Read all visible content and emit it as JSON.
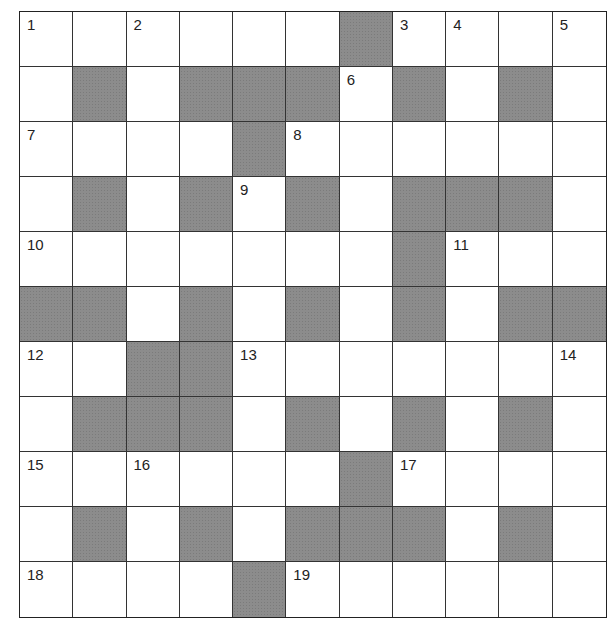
{
  "puzzle": {
    "type": "crossword",
    "rows": 11,
    "cols": 11,
    "colors": {
      "block": "#8c8c8c",
      "cell": "#ffffff",
      "line": "#333333"
    },
    "grid": [
      "WWWWWWBWWWW",
      "WBWBBBWBWBW",
      "WWWWBWWWWWW",
      "WBWBWBWBBBW",
      "WWWWWWWBWWW",
      "BBWBWBWBWBB",
      "WWBBWWWWWWW",
      "WBBBWBWBWBW",
      "WWWWWWBWWWW",
      "WBWBWBBBWBW",
      "WWWWBWWWWWW"
    ],
    "numbers": [
      {
        "row": 0,
        "col": 0,
        "label": "1"
      },
      {
        "row": 0,
        "col": 2,
        "label": "2"
      },
      {
        "row": 0,
        "col": 7,
        "label": "3"
      },
      {
        "row": 0,
        "col": 8,
        "label": "4"
      },
      {
        "row": 0,
        "col": 10,
        "label": "5"
      },
      {
        "row": 1,
        "col": 6,
        "label": "6"
      },
      {
        "row": 2,
        "col": 0,
        "label": "7"
      },
      {
        "row": 2,
        "col": 5,
        "label": "8"
      },
      {
        "row": 3,
        "col": 4,
        "label": "9"
      },
      {
        "row": 4,
        "col": 0,
        "label": "10"
      },
      {
        "row": 4,
        "col": 8,
        "label": "11"
      },
      {
        "row": 6,
        "col": 0,
        "label": "12"
      },
      {
        "row": 6,
        "col": 4,
        "label": "13"
      },
      {
        "row": 6,
        "col": 10,
        "label": "14"
      },
      {
        "row": 8,
        "col": 0,
        "label": "15"
      },
      {
        "row": 8,
        "col": 2,
        "label": "16"
      },
      {
        "row": 8,
        "col": 7,
        "label": "17"
      },
      {
        "row": 10,
        "col": 0,
        "label": "18"
      },
      {
        "row": 10,
        "col": 5,
        "label": "19"
      }
    ]
  }
}
